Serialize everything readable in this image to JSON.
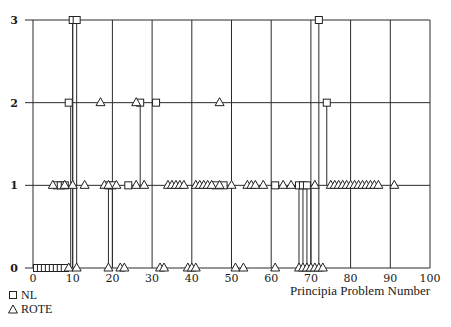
{
  "chart_data": {
    "type": "scatter",
    "title": "",
    "xlabel": "Principia Problem Number",
    "ylabel": "",
    "xlim": [
      0,
      100
    ],
    "ylim": [
      0,
      3
    ],
    "x_ticks": [
      0,
      10,
      20,
      30,
      40,
      50,
      60,
      70,
      80,
      90,
      100
    ],
    "y_ticks": [
      0,
      1,
      2,
      3
    ],
    "grid": true,
    "legend_position": "bottom-left",
    "series": [
      {
        "name": "NL",
        "marker": "square",
        "points": [
          [
            1,
            0
          ],
          [
            2,
            0
          ],
          [
            3,
            0
          ],
          [
            4,
            0
          ],
          [
            5,
            0
          ],
          [
            6,
            0
          ],
          [
            7,
            0
          ],
          [
            8,
            0
          ],
          [
            6,
            1
          ],
          [
            7,
            1
          ],
          [
            8,
            1
          ],
          [
            9,
            2
          ],
          [
            10,
            3
          ],
          [
            11,
            3
          ],
          [
            19,
            1
          ],
          [
            20,
            1
          ],
          [
            24,
            1
          ],
          [
            27,
            2
          ],
          [
            31,
            2
          ],
          [
            46,
            1
          ],
          [
            48,
            1
          ],
          [
            61,
            1
          ],
          [
            67,
            1
          ],
          [
            68,
            1
          ],
          [
            69,
            1
          ],
          [
            72,
            3
          ],
          [
            74,
            2
          ]
        ]
      },
      {
        "name": "ROTE",
        "marker": "triangle",
        "points": [
          [
            9,
            0
          ],
          [
            11,
            0
          ],
          [
            5,
            1
          ],
          [
            8,
            1
          ],
          [
            10,
            1
          ],
          [
            13,
            1
          ],
          [
            17,
            2
          ],
          [
            18,
            1
          ],
          [
            19,
            1
          ],
          [
            21,
            1
          ],
          [
            26,
            1
          ],
          [
            28,
            1
          ],
          [
            19,
            0
          ],
          [
            22,
            0
          ],
          [
            23,
            0
          ],
          [
            26,
            2
          ],
          [
            32,
            0
          ],
          [
            33,
            0
          ],
          [
            34,
            1
          ],
          [
            35,
            1
          ],
          [
            36,
            1
          ],
          [
            37,
            1
          ],
          [
            38,
            1
          ],
          [
            39,
            0
          ],
          [
            40,
            0
          ],
          [
            41,
            0
          ],
          [
            41,
            1
          ],
          [
            42,
            1
          ],
          [
            43,
            1
          ],
          [
            44,
            1
          ],
          [
            45,
            1
          ],
          [
            47,
            2
          ],
          [
            47,
            1
          ],
          [
            50,
            1
          ],
          [
            51,
            0
          ],
          [
            53,
            0
          ],
          [
            54,
            1
          ],
          [
            55,
            1
          ],
          [
            56,
            1
          ],
          [
            58,
            1
          ],
          [
            61,
            0
          ],
          [
            63,
            1
          ],
          [
            65,
            1
          ],
          [
            67,
            0
          ],
          [
            68,
            0
          ],
          [
            69,
            0
          ],
          [
            70,
            0
          ],
          [
            71,
            0
          ],
          [
            72,
            0
          ],
          [
            73,
            0
          ],
          [
            71,
            1
          ],
          [
            75,
            1
          ],
          [
            76,
            1
          ],
          [
            77,
            1
          ],
          [
            78,
            1
          ],
          [
            79,
            1
          ],
          [
            80,
            1
          ],
          [
            81,
            1
          ],
          [
            82,
            1
          ],
          [
            83,
            1
          ],
          [
            84,
            1
          ],
          [
            85,
            1
          ],
          [
            86,
            1
          ],
          [
            87,
            1
          ],
          [
            91,
            1
          ]
        ]
      }
    ],
    "stems": [
      {
        "x": 9.5,
        "from": 0,
        "to": 2
      },
      {
        "x": 10,
        "from": 0,
        "to": 3
      },
      {
        "x": 11,
        "from": 0,
        "to": 3
      },
      {
        "x": 19,
        "from": 0,
        "to": 1
      },
      {
        "x": 20,
        "from": 0,
        "to": 1
      },
      {
        "x": 27,
        "from": 1,
        "to": 2
      },
      {
        "x": 67,
        "from": 0,
        "to": 1
      },
      {
        "x": 68,
        "from": 0,
        "to": 1
      },
      {
        "x": 69,
        "from": 0,
        "to": 1
      },
      {
        "x": 70,
        "from": 0,
        "to": 1
      },
      {
        "x": 72,
        "from": 0,
        "to": 3
      },
      {
        "x": 74,
        "from": 1,
        "to": 2
      }
    ]
  },
  "legend": {
    "nl_label": "NL",
    "rote_label": "ROTE"
  },
  "axis": {
    "xlabel": "Principia Problem Number"
  }
}
